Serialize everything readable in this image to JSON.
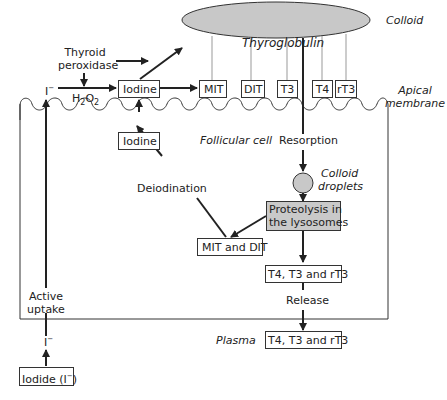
{
  "regions": {
    "colloid": "Colloid",
    "apical_membrane_line1": "Apical",
    "apical_membrane_line2": "membrane",
    "follicular_cell": "Follicular cell",
    "plasma": "Plasma"
  },
  "thyroglobulin": "Thyroglobulin",
  "enzyme": {
    "line1": "Thyroid",
    "line2": "peroxidase"
  },
  "iodide_ion": "I",
  "iodide_ion_charge": "−",
  "h2o2": {
    "base": "H",
    "sub1": "2",
    "mid": "O",
    "sub2": "2"
  },
  "colloid_boxes": {
    "iodine": "Iodine",
    "mit": "MIT",
    "dit": "DIT",
    "t3": "T3",
    "t4": "T4",
    "rt3": "rT3"
  },
  "cell_boxes": {
    "iodine": "Iodine",
    "mit_dit": "MIT and DIT",
    "proteolysis_line1": "Proteolysis in",
    "proteolysis_line2": "the lysosomes",
    "hormones": "T4, T3 and rT3"
  },
  "process_labels": {
    "resorption": "Resorption",
    "colloid_droplets_line1": "Colloid",
    "colloid_droplets_line2": "droplets",
    "deiodination": "Deiodination",
    "release": "Release",
    "active_uptake_line1": "Active",
    "active_uptake_line2": "uptake"
  },
  "plasma_boxes": {
    "hormones": "T4, T3 and rT3",
    "iodide": "Iodide (I",
    "iodide_charge": "−",
    "iodide_close": ")"
  },
  "colors": {
    "thyroglobulin_fill": "#c8c8c8",
    "droplet_fill": "#c8c8c8",
    "proteolysis_fill": "#c9c9c9",
    "line": "#222222",
    "thin_line": "#888888"
  }
}
